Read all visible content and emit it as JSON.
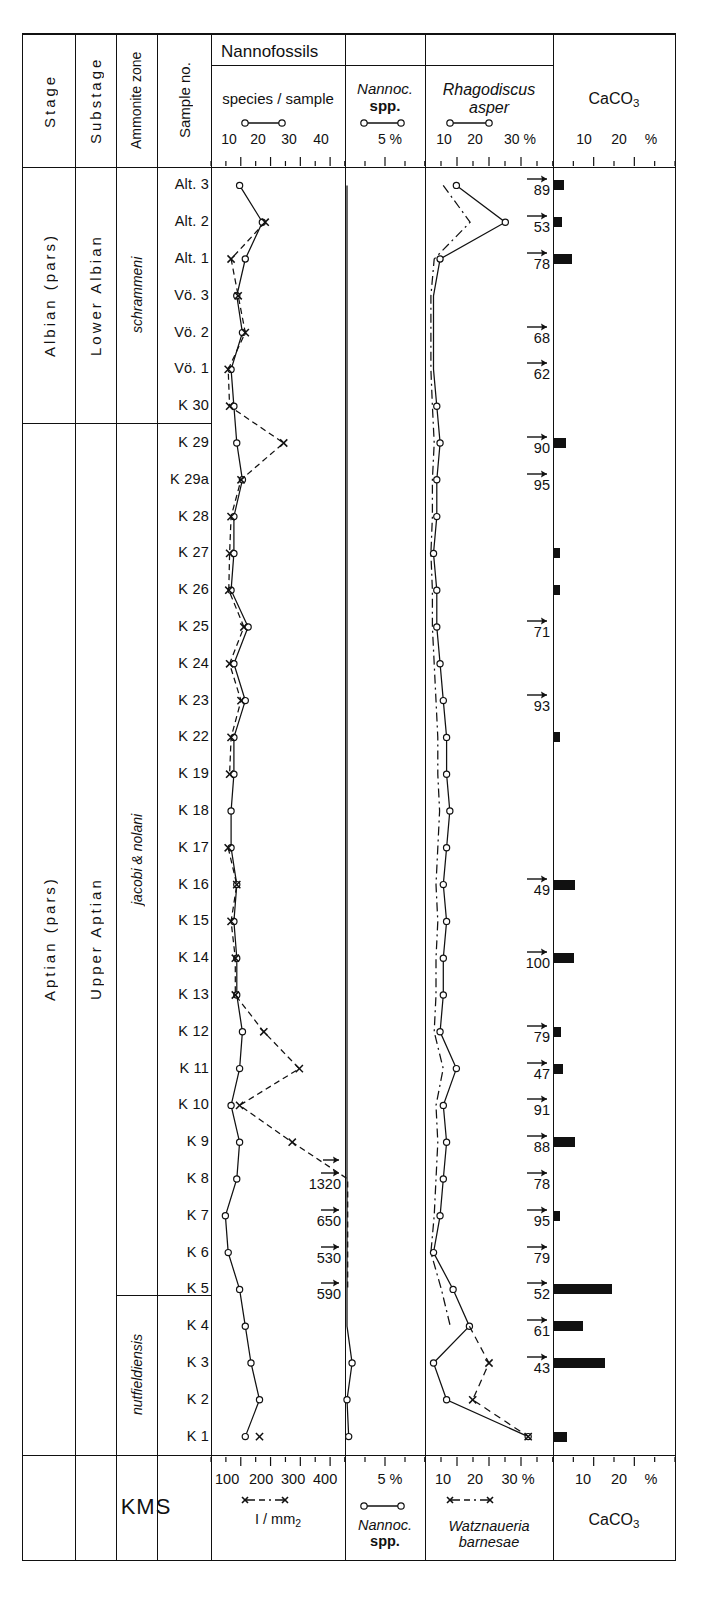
{
  "figure": {
    "section_label": "KMS",
    "group_header": "Nannofossils"
  },
  "columns": {
    "stage": "Stage",
    "substage": "Substage",
    "ammonite_zone": "Ammonite zone",
    "sample_no": "Sample no.",
    "species_per_sample": "species / sample",
    "nannoconus": "Nannoc. spp.",
    "rhagodiscus": "Rhagodiscus asper",
    "caco3": "CaCO3"
  },
  "axes": {
    "species_top_ticks": [
      "10",
      "20",
      "30",
      "40"
    ],
    "nannoc_top_ticks": [
      "5 %"
    ],
    "rhago_top_ticks": [
      "10",
      "20",
      "30 %"
    ],
    "caco3_top_ticks": [
      "10",
      "20",
      "%"
    ],
    "species_bottom_ticks": [
      "100",
      "200",
      "300",
      "400"
    ],
    "species_bottom_unit": "I / mm2",
    "nannoc_bottom_ticks": [
      "5 %"
    ],
    "nannoc_bottom_label": "Nannoc. spp.",
    "watznaueria_bottom_ticks": [
      "10",
      "20",
      "30 %"
    ],
    "watznaueria_bottom_label": "Watznaueria barnesae",
    "caco3_bottom_ticks": [
      "10",
      "20",
      "%"
    ],
    "caco3_bottom_label": "CaCO3"
  },
  "stages": [
    {
      "label": "Albian (pars)",
      "span_start": 0,
      "span_end": 6
    },
    {
      "label": "Aptian (pars)",
      "span_start": 6,
      "span_end": 33
    }
  ],
  "substages": [
    {
      "label": "Lower Albian",
      "span_start": 0,
      "span_end": 6
    },
    {
      "label": "Upper Aptian",
      "span_start": 6,
      "span_end": 33
    }
  ],
  "ammonite_zones": [
    {
      "label": "schrammeni",
      "span_start": 0,
      "span_end": 6
    },
    {
      "label": "jacobi & nolani",
      "span_start": 6,
      "span_end": 28
    },
    {
      "label": "nutfieldiensis",
      "span_start": 28,
      "span_end": 33
    }
  ],
  "samples": [
    "Alt. 3",
    "Alt. 2",
    "Alt. 1",
    "Vö. 3",
    "Vö. 2",
    "Vö. 1",
    "K  30",
    "K  29",
    "K  29a",
    "K  28",
    "K  27",
    "K  26",
    "K  25",
    "K  24",
    "K  23",
    "K  22",
    "K  19",
    "K  18",
    "K  17",
    "K  16",
    "K  15",
    "K  14",
    "K  13",
    "K  12",
    "K  11",
    "K  10",
    "K  9",
    "K  8",
    "K  7",
    "K  6",
    "K  5",
    "K  4",
    "K  3",
    "K  2",
    "K  1"
  ],
  "chart_data": [
    {
      "type": "line",
      "title": "species / sample",
      "xlabel": "species / sample",
      "ylabel": "Sample no.",
      "xlim": [
        0,
        45
      ],
      "axis_ticks": [
        10,
        20,
        30,
        40
      ],
      "orientation": "vertical-stratigraphic",
      "series": [
        {
          "name": "species / sample",
          "marker": "circle",
          "linestyle": "solid",
          "values": [
            9,
            17,
            11,
            8,
            10,
            6,
            7,
            8,
            10,
            7,
            7,
            6,
            12,
            7,
            11,
            7,
            7,
            6,
            6,
            8,
            7,
            8,
            8,
            10,
            9,
            6,
            9,
            8,
            4,
            5,
            9,
            11,
            13,
            16,
            11
          ]
        },
        {
          "name": "I / mm2",
          "marker": "x",
          "linestyle": "dashed",
          "unit": "I / mm2",
          "values": [
            null,
            180,
            60,
            85,
            110,
            50,
            55,
            245,
            95,
            60,
            55,
            52,
            105,
            55,
            95,
            60,
            55,
            null,
            50,
            80,
            60,
            75,
            75,
            175,
            300,
            90,
            275,
            1320,
            650,
            530,
            590,
            null,
            null,
            null,
            160
          ],
          "offscale_labels": {
            "27": "1320",
            "28": "650",
            "29": "530",
            "30": "590"
          }
        }
      ]
    },
    {
      "type": "line",
      "title": "Nannoc. spp.",
      "xlabel": "Nannoc. spp.",
      "xlim": [
        0,
        9
      ],
      "axis_ticks": [
        5
      ],
      "unit": "%",
      "series": [
        {
          "name": "Nannoconus spp.",
          "marker": "circle",
          "linestyle": "solid",
          "values": [
            0,
            0,
            0,
            0,
            0,
            0,
            0,
            0,
            0,
            0,
            0,
            0,
            0,
            0,
            0,
            0,
            0,
            0,
            0,
            0,
            0,
            0,
            0,
            0,
            0,
            0,
            0,
            0,
            0,
            0,
            0,
            0,
            0.6,
            0,
            0.2
          ]
        }
      ]
    },
    {
      "type": "line",
      "title": "Rhagodiscus asper / Watznaueria barnesae",
      "xlim": [
        0,
        38
      ],
      "axis_ticks": [
        10,
        20,
        30
      ],
      "unit": "%",
      "series": [
        {
          "name": "Rhagodiscus asper",
          "marker": "circle",
          "linestyle": "solid",
          "values": [
            9,
            24,
            4,
            2,
            2,
            2,
            3,
            4,
            3,
            3,
            2,
            3,
            3,
            4,
            5,
            6,
            6,
            7,
            6,
            5,
            6,
            5,
            5,
            4,
            9,
            5,
            6,
            5,
            4,
            2,
            8,
            13,
            2,
            6,
            31
          ]
        },
        {
          "name": "Watznaueria barnesae",
          "marker": "x",
          "linestyle": "dashdot-upper-dashed-lower",
          "values": [
            null,
            null,
            null,
            null,
            null,
            null,
            null,
            null,
            null,
            null,
            null,
            null,
            null,
            null,
            null,
            null,
            null,
            null,
            null,
            null,
            null,
            null,
            null,
            null,
            null,
            null,
            null,
            null,
            null,
            null,
            null,
            null,
            19,
            14,
            31
          ]
        }
      ]
    },
    {
      "type": "bar",
      "title": "CaCO3",
      "xlabel": "CaCO3",
      "unit": "%",
      "axis_ticks": [
        10,
        20
      ],
      "xlim": [
        0,
        26
      ],
      "note": "Values above 26% shown as arrow with numeric label",
      "values": [
        {
          "sample": "Alt. 3",
          "label": "89",
          "bar": 2.2
        },
        {
          "sample": "Alt. 2",
          "label": "53",
          "bar": 1.8
        },
        {
          "sample": "Alt. 1",
          "label": "78",
          "bar": 4.0
        },
        {
          "sample": "Vö. 3",
          "label": "",
          "bar": 0
        },
        {
          "sample": "Vö. 2",
          "label": "68",
          "bar": 0
        },
        {
          "sample": "Vö. 1",
          "label": "62",
          "bar": 0
        },
        {
          "sample": "K  30",
          "label": "",
          "bar": 0
        },
        {
          "sample": "K  29",
          "label": "90",
          "bar": 2.6
        },
        {
          "sample": "K  29a",
          "label": "95",
          "bar": 0
        },
        {
          "sample": "K  28",
          "label": "",
          "bar": 0
        },
        {
          "sample": "K  27",
          "label": "",
          "bar": 1.3
        },
        {
          "sample": "K  26",
          "label": "",
          "bar": 1.3
        },
        {
          "sample": "K  25",
          "label": "71",
          "bar": 0
        },
        {
          "sample": "K  24",
          "label": "",
          "bar": 0
        },
        {
          "sample": "K  23",
          "label": "93",
          "bar": 0
        },
        {
          "sample": "K  22",
          "label": "",
          "bar": 1.4
        },
        {
          "sample": "K  19",
          "label": "",
          "bar": 0
        },
        {
          "sample": "K  18",
          "label": "",
          "bar": 0
        },
        {
          "sample": "K  17",
          "label": "",
          "bar": 0
        },
        {
          "sample": "K  16",
          "label": "49",
          "bar": 4.6
        },
        {
          "sample": "K  15",
          "label": "",
          "bar": 0
        },
        {
          "sample": "K  14",
          "label": "100",
          "bar": 4.4
        },
        {
          "sample": "K  13",
          "label": "",
          "bar": 0
        },
        {
          "sample": "K  12",
          "label": "79",
          "bar": 1.6
        },
        {
          "sample": "K  11",
          "label": "47",
          "bar": 2.0
        },
        {
          "sample": "K  10",
          "label": "91",
          "bar": 0
        },
        {
          "sample": "K  9",
          "label": "88",
          "bar": 4.8
        },
        {
          "sample": "K  8",
          "label": "78",
          "bar": 0
        },
        {
          "sample": "K  7",
          "label": "95",
          "bar": 1.4
        },
        {
          "sample": "K  6",
          "label": "79",
          "bar": 0
        },
        {
          "sample": "K  5",
          "label": "52",
          "bar": 13.0
        },
        {
          "sample": "K  4",
          "label": "61",
          "bar": 6.5
        },
        {
          "sample": "K  3",
          "label": "43",
          "bar": 11.5
        },
        {
          "sample": "K  2",
          "label": "",
          "bar": 0
        },
        {
          "sample": "K  1",
          "label": "",
          "bar": 3.0
        }
      ]
    }
  ],
  "colors": {
    "ink": "#111111",
    "background": "#ffffff"
  }
}
